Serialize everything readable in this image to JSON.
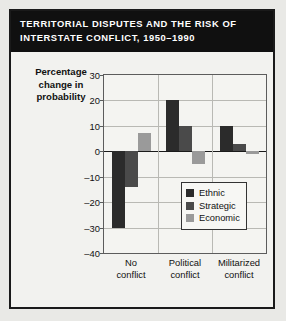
{
  "title": {
    "line1": "TERRITORIAL DISPUTES AND THE RISK OF",
    "line2": "INTERSTATE CONFLICT, 1950–1990"
  },
  "axis_title": {
    "line1": "Percentage",
    "line2": "change in",
    "line3": "probability"
  },
  "legend": {
    "items": [
      {
        "label": "Ethnic",
        "color": "#2b2b2b"
      },
      {
        "label": "Strategic",
        "color": "#4a4a4a"
      },
      {
        "label": "Economic",
        "color": "#9a9a9a"
      }
    ]
  },
  "ticks": {
    "t30": "30",
    "t20": "20",
    "t10": "10",
    "t0": "0",
    "tm10": "–10",
    "tm20": "–20",
    "tm30": "–30",
    "tm40": "–40"
  },
  "xlabels": [
    {
      "line1": "No",
      "line2": "conflict"
    },
    {
      "line1": "Political",
      "line2": "conflict"
    },
    {
      "line1": "Militarized",
      "line2": "conflict"
    }
  ],
  "chart_data": {
    "type": "bar",
    "title": "TERRITORIAL DISPUTES AND THE RISK OF INTERSTATE CONFLICT, 1950–1990",
    "xlabel": "",
    "ylabel": "Percentage change in probability",
    "categories": [
      "No conflict",
      "Political conflict",
      "Militarized conflict"
    ],
    "series": [
      {
        "name": "Ethnic",
        "color": "#2b2b2b",
        "values": [
          -30,
          20,
          10
        ]
      },
      {
        "name": "Strategic",
        "color": "#4a4a4a",
        "values": [
          -14,
          10,
          3
        ]
      },
      {
        "name": "Economic",
        "color": "#9a9a9a",
        "values": [
          7,
          -5,
          -1
        ]
      }
    ],
    "ylim": [
      -40,
      30
    ],
    "yticks": [
      30,
      20,
      10,
      0,
      -10,
      -20,
      -30,
      -40
    ],
    "grid": true,
    "legend_position": "inside-bottom-right"
  }
}
